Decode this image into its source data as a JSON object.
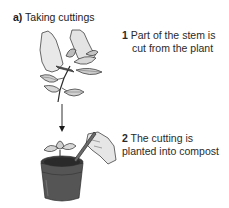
{
  "figure": {
    "label": "a)",
    "title": "Taking cuttings"
  },
  "steps": [
    {
      "number": "1",
      "line1": "Part of the stem is",
      "line2": "cut from the plant"
    },
    {
      "number": "2",
      "line1": "The cutting is",
      "line2": "planted into compost"
    }
  ],
  "illustrations": {
    "top": "hands-cutting-plant-stem",
    "bottom": "hand-planting-cutting-in-pot",
    "connector": "down-arrow"
  },
  "colors": {
    "line": "#2b2b2b",
    "skin": "#e6e6e6",
    "leaf_light": "#d8d8d8",
    "leaf_dark": "#7a7a7a",
    "pot": "#4a4a4a",
    "compost": "#2e2e2e"
  }
}
